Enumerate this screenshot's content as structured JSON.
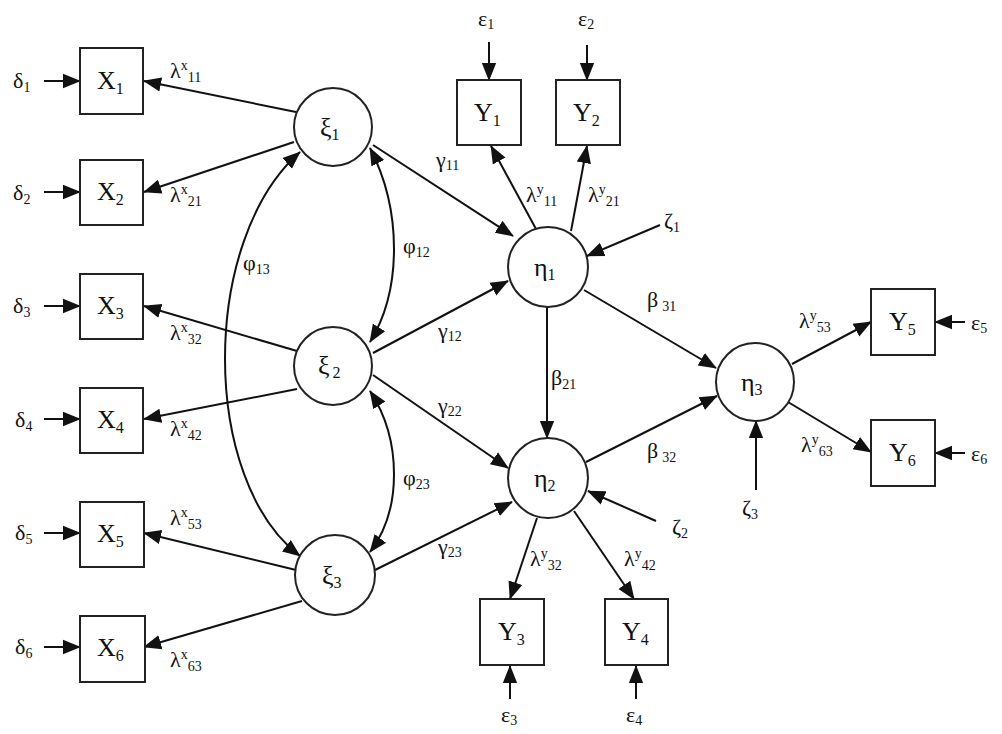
{
  "diagram": {
    "type": "structural-equation-model",
    "exogenous_latents": [
      {
        "id": "xi1",
        "symbol": "ξ",
        "sub": "1"
      },
      {
        "id": "xi2",
        "symbol": "ξ",
        "sub": "2"
      },
      {
        "id": "xi3",
        "symbol": "ξ",
        "sub": "3"
      }
    ],
    "endogenous_latents": [
      {
        "id": "eta1",
        "symbol": "η",
        "sub": "1"
      },
      {
        "id": "eta2",
        "symbol": "η",
        "sub": "2"
      },
      {
        "id": "eta3",
        "symbol": "η",
        "sub": "3"
      }
    ],
    "x_indicators": [
      {
        "id": "X1",
        "symbol": "X",
        "sub": "1",
        "error": {
          "symbol": "δ",
          "sub": "1"
        },
        "loading": {
          "symbol": "λ",
          "sup": "x",
          "sub": "11"
        }
      },
      {
        "id": "X2",
        "symbol": "X",
        "sub": "2",
        "error": {
          "symbol": "δ",
          "sub": "2"
        },
        "loading": {
          "symbol": "λ",
          "sup": "x",
          "sub": "21"
        }
      },
      {
        "id": "X3",
        "symbol": "X",
        "sub": "3",
        "error": {
          "symbol": "δ",
          "sub": "3"
        },
        "loading": {
          "symbol": "λ",
          "sup": "x",
          "sub": "32"
        }
      },
      {
        "id": "X4",
        "symbol": "X",
        "sub": "4",
        "error": {
          "symbol": "δ",
          "sub": "4"
        },
        "loading": {
          "symbol": "λ",
          "sup": "x",
          "sub": "42"
        }
      },
      {
        "id": "X5",
        "symbol": "X",
        "sub": "5",
        "error": {
          "symbol": "δ",
          "sub": "5"
        },
        "loading": {
          "symbol": "λ",
          "sup": "x",
          "sub": "53"
        }
      },
      {
        "id": "X6",
        "symbol": "X",
        "sub": "6",
        "error": {
          "symbol": "δ",
          "sub": "6"
        },
        "loading": {
          "symbol": "λ",
          "sup": "x",
          "sub": "63"
        }
      }
    ],
    "y_indicators": [
      {
        "id": "Y1",
        "symbol": "Y",
        "sub": "1",
        "error": {
          "symbol": "ε",
          "sub": "1"
        },
        "loading": {
          "symbol": "λ",
          "sup": "y",
          "sub": "11"
        }
      },
      {
        "id": "Y2",
        "symbol": "Y",
        "sub": "2",
        "error": {
          "symbol": "ε",
          "sub": "2"
        },
        "loading": {
          "symbol": "λ",
          "sup": "y",
          "sub": "21"
        }
      },
      {
        "id": "Y3",
        "symbol": "Y",
        "sub": "3",
        "error": {
          "symbol": "ε",
          "sub": "3"
        },
        "loading": {
          "symbol": "λ",
          "sup": "y",
          "sub": "32"
        }
      },
      {
        "id": "Y4",
        "symbol": "Y",
        "sub": "4",
        "error": {
          "symbol": "ε",
          "sub": "4"
        },
        "loading": {
          "symbol": "λ",
          "sup": "y",
          "sub": "42"
        }
      },
      {
        "id": "Y5",
        "symbol": "Y",
        "sub": "5",
        "error": {
          "symbol": "ε",
          "sub": "5"
        },
        "loading": {
          "symbol": "λ",
          "sup": "y",
          "sub": "53"
        }
      },
      {
        "id": "Y6",
        "symbol": "Y",
        "sub": "6",
        "error": {
          "symbol": "ε",
          "sub": "6"
        },
        "loading": {
          "symbol": "λ",
          "sup": "y",
          "sub": "63"
        }
      }
    ],
    "disturbances": [
      {
        "symbol": "ζ",
        "sub": "1"
      },
      {
        "symbol": "ζ",
        "sub": "2"
      },
      {
        "symbol": "ζ",
        "sub": "3"
      }
    ],
    "gammas": [
      {
        "symbol": "γ",
        "sub": "11"
      },
      {
        "symbol": "γ",
        "sub": "12"
      },
      {
        "symbol": "γ",
        "sub": "22"
      },
      {
        "symbol": "γ",
        "sub": "23"
      }
    ],
    "betas": [
      {
        "symbol": "β",
        "sub": "21"
      },
      {
        "symbol": "β",
        "sub": "31"
      },
      {
        "symbol": "β",
        "sub": "32"
      }
    ],
    "phis": [
      {
        "symbol": "φ",
        "sub": "12"
      },
      {
        "symbol": "φ",
        "sub": "13"
      },
      {
        "symbol": "φ",
        "sub": "23"
      }
    ]
  }
}
